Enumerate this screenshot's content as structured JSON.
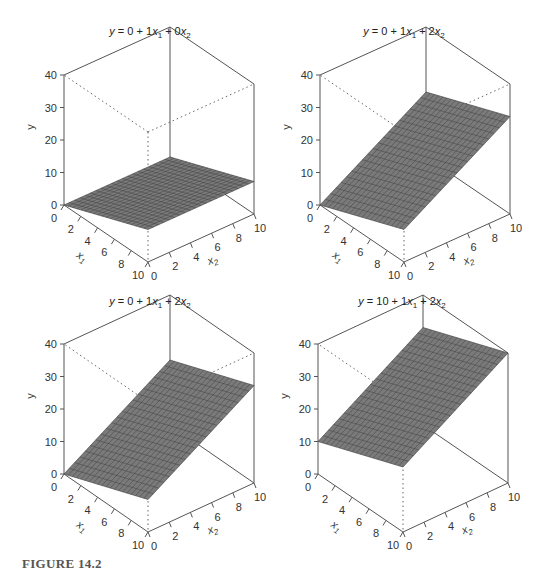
{
  "figure": {
    "caption": "FIGURE 14.2"
  },
  "chart_data": [
    {
      "type": "surface3d",
      "title": "y = 0 + 1x1 + 0x2",
      "title_parts": {
        "intercept": "0",
        "b1": "1",
        "b2": "0"
      },
      "intercept": 0,
      "b1": 1,
      "b2": 0,
      "xlabel": "x1",
      "x2label": "x2",
      "ylabel": "y",
      "x1_ticks": [
        0,
        2,
        4,
        6,
        8,
        10
      ],
      "x2_ticks": [
        0,
        2,
        4,
        6,
        8,
        10
      ],
      "y_ticks": [
        0,
        10,
        20,
        30,
        40
      ],
      "x1_range": [
        0,
        10
      ],
      "x2_range": [
        0,
        10
      ],
      "ylim": [
        0,
        40
      ],
      "surface_corners": {
        "x1_0_x2_0": 0,
        "x1_10_x2_0": 10,
        "x1_0_x2_10": 0,
        "x1_10_x2_10": 10
      },
      "anchor": {
        "origin": [
          64,
          205
        ],
        "x1_end": [
          148,
          262
        ],
        "far": [
          254,
          214
        ],
        "height_px": 130
      },
      "title_pos": [
        150,
        34
      ]
    },
    {
      "type": "surface3d",
      "title": "y = 0 + 1x1 + 2x2",
      "title_parts": {
        "intercept": "0",
        "b1": "1",
        "b2": "2"
      },
      "intercept": 0,
      "b1": 1,
      "b2": 2,
      "xlabel": "x1",
      "x2label": "x2",
      "ylabel": "y",
      "x1_ticks": [
        0,
        2,
        4,
        6,
        8,
        10
      ],
      "x2_ticks": [
        0,
        2,
        4,
        6,
        8,
        10
      ],
      "y_ticks": [
        0,
        10,
        20,
        30,
        40
      ],
      "x1_range": [
        0,
        10
      ],
      "x2_range": [
        0,
        10
      ],
      "ylim": [
        0,
        40
      ],
      "surface_corners": {
        "x1_0_x2_0": 0,
        "x1_10_x2_0": 10,
        "x1_0_x2_10": 20,
        "x1_10_x2_10": 30
      },
      "anchor": {
        "origin": [
          320,
          205
        ],
        "x1_end": [
          404,
          262
        ],
        "far": [
          510,
          214
        ],
        "height_px": 130
      },
      "title_pos": [
        404,
        34
      ]
    },
    {
      "type": "surface3d",
      "title": "y = 0 + 1x1 + 2x2",
      "title_parts": {
        "intercept": "0",
        "b1": "1",
        "b2": "2"
      },
      "intercept": 0,
      "b1": 1,
      "b2": 2,
      "xlabel": "x1",
      "x2label": "x2",
      "ylabel": "y",
      "x1_ticks": [
        0,
        2,
        4,
        6,
        8,
        10
      ],
      "x2_ticks": [
        0,
        2,
        4,
        6,
        8,
        10
      ],
      "y_ticks": [
        0,
        10,
        20,
        30,
        40
      ],
      "x1_range": [
        0,
        10
      ],
      "x2_range": [
        0,
        10
      ],
      "ylim": [
        0,
        40
      ],
      "surface_corners": {
        "x1_0_x2_0": 0,
        "x1_10_x2_0": 10,
        "x1_0_x2_10": 20,
        "x1_10_x2_10": 30
      },
      "anchor": {
        "origin": [
          64,
          474
        ],
        "x1_end": [
          148,
          532
        ],
        "far": [
          254,
          483
        ],
        "height_px": 130
      },
      "title_pos": [
        150,
        304
      ]
    },
    {
      "type": "surface3d",
      "title": "y = 10 + 1x1 + 2x2",
      "title_parts": {
        "intercept": "10",
        "b1": "1",
        "b2": "2"
      },
      "intercept": 10,
      "b1": 1,
      "b2": 2,
      "xlabel": "x1",
      "x2label": "x2",
      "ylabel": "y",
      "x1_ticks": [
        0,
        2,
        4,
        6,
        8,
        10
      ],
      "x2_ticks": [
        0,
        2,
        4,
        6,
        8,
        10
      ],
      "y_ticks": [
        0,
        10,
        20,
        30,
        40
      ],
      "x1_range": [
        0,
        10
      ],
      "x2_range": [
        0,
        10
      ],
      "ylim": [
        0,
        40
      ],
      "surface_corners": {
        "x1_0_x2_0": 10,
        "x1_10_x2_0": 20,
        "x1_0_x2_10": 30,
        "x1_10_x2_10": 40
      },
      "anchor": {
        "origin": [
          318,
          474
        ],
        "x1_end": [
          403,
          532
        ],
        "far": [
          508,
          483
        ],
        "height_px": 130
      },
      "title_pos": [
        402,
        304
      ]
    }
  ],
  "style": {
    "surface_fill": "#7a7a7a",
    "grid_line": "#3a3a3a",
    "box_line": "#555555",
    "dotted_line": "#666666",
    "text": "#333333"
  }
}
